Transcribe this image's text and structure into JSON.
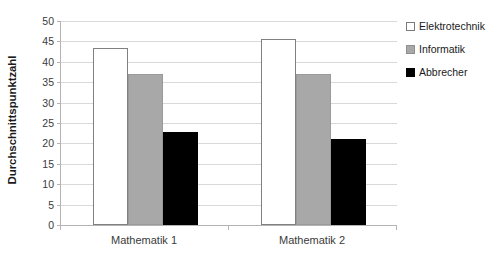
{
  "chart_data": {
    "type": "bar",
    "title": "",
    "subtitle": "",
    "xlabel": "",
    "ylabel": "Durchschnittspunktzahl",
    "categories": [
      "Mathematik 1",
      "Mathematik 2"
    ],
    "series": [
      {
        "name": "Elektrotechnik",
        "color": "#ffffff",
        "values": [
          43.3,
          45.6
        ]
      },
      {
        "name": "Informatik",
        "color": "#a8a8a8",
        "values": [
          37.1,
          37.1
        ]
      },
      {
        "name": "Abbrecher",
        "color": "#000000",
        "values": [
          22.7,
          21.2
        ]
      }
    ],
    "ylim": [
      0,
      50
    ],
    "ytick_step": 5,
    "yticks": [
      0,
      5,
      10,
      15,
      20,
      25,
      30,
      35,
      40,
      45,
      50
    ],
    "ytick_labels": [
      "0",
      "5",
      "10",
      "15",
      "20",
      "25",
      "30",
      "35",
      "40",
      "45",
      "50"
    ],
    "grid": true,
    "grid_axis": "y",
    "legend_position": "right",
    "annotations": []
  },
  "legend": {
    "items": [
      {
        "label": "Elektrotechnik",
        "swatch": "legend-swatch-white"
      },
      {
        "label": "Informatik",
        "swatch": "legend-swatch-gray"
      },
      {
        "label": "Abbrecher",
        "swatch": "legend-swatch-black"
      }
    ]
  }
}
